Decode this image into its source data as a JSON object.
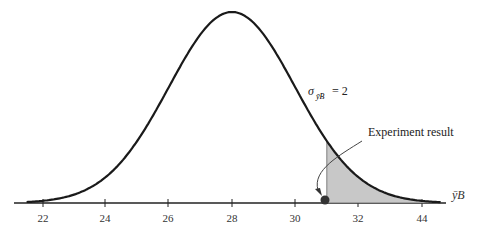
{
  "chart_data": {
    "type": "line",
    "title": "",
    "mean": 28,
    "sigma": 2,
    "xlabel": "ȳB",
    "ylabel": "",
    "x_ticks": [
      "22",
      "24",
      "26",
      "28",
      "30",
      "32",
      "44"
    ],
    "annotations": {
      "sigma_label": "σ",
      "sigma_sub": "ȳB",
      "sigma_value": "= 2",
      "experiment_label": "Experiment result",
      "experiment_value": 31
    },
    "shaded_region": {
      "from": 31,
      "to": "right tail"
    },
    "grid": false
  }
}
